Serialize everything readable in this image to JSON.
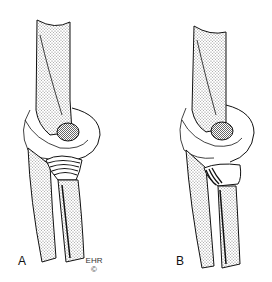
{
  "figure": {
    "panels": [
      {
        "label": "A",
        "description": "Elbow lateral view, proximal radius with striated (ridged) head"
      },
      {
        "label": "B",
        "description": "Elbow lateral view, proximal radius with smaller striated region"
      }
    ],
    "signature": {
      "initials": "EHR",
      "copyright": "©"
    }
  }
}
